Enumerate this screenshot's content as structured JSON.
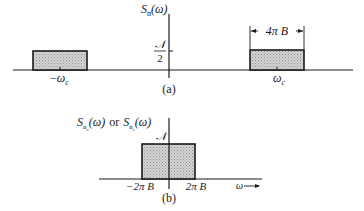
{
  "panel_a": {
    "caption": "(a)",
    "y_label": {
      "main": "S",
      "sub": "n",
      "arg": "(ω)"
    },
    "level_label": {
      "num": "𝒩",
      "den": "2"
    },
    "left_band": {
      "label_sign": "−",
      "label_main": "ω",
      "label_sub": "c"
    },
    "right_band": {
      "label_main": "ω",
      "label_sub": "c",
      "width_label": "4π B"
    }
  },
  "panel_b": {
    "caption": "(b)",
    "y_label": {
      "first_main": "S",
      "first_sub": "n",
      "first_subsub": "c",
      "first_arg": "(ω)",
      "connector": "or",
      "second_main": "S",
      "second_sub": "n",
      "second_subsub": "s",
      "second_arg": "(ω)"
    },
    "level_label": "𝒩",
    "left_edge_label": "−2π B",
    "right_edge_label": "2π B",
    "x_axis_label": "ω",
    "x_axis_arrow": "⟶"
  },
  "colors": {
    "ink": "#1a1a1a",
    "fill": "#c8c8c8"
  }
}
